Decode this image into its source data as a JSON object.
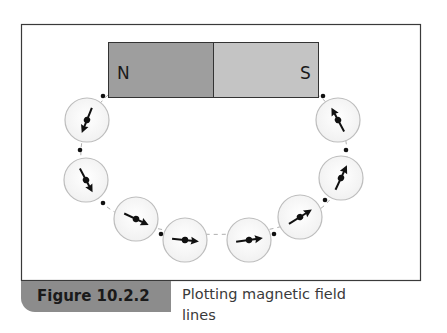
{
  "figure": {
    "magnet": {
      "north_label": "N",
      "south_label": "S",
      "north_color": "#9e9e9e",
      "south_color": "#c4c4c4"
    },
    "compasses": [
      {
        "id": 1,
        "cx": 87,
        "cy": 120,
        "angle": 245
      },
      {
        "id": 2,
        "cx": 86,
        "cy": 180,
        "angle": 68
      },
      {
        "id": 3,
        "cx": 136,
        "cy": 219,
        "angle": 25
      },
      {
        "id": 4,
        "cx": 185,
        "cy": 240,
        "angle": 5
      },
      {
        "id": 5,
        "cx": 249,
        "cy": 240,
        "angle": -8
      },
      {
        "id": 6,
        "cx": 300,
        "cy": 217,
        "angle": -32
      },
      {
        "id": 7,
        "cx": 341,
        "cy": 178,
        "angle": -65
      },
      {
        "id": 8,
        "cx": 338,
        "cy": 120,
        "angle": -118
      }
    ],
    "plot_points": [
      [
        103,
        96
      ],
      [
        80,
        150
      ],
      [
        103,
        203
      ],
      [
        161,
        234
      ],
      [
        274,
        234
      ],
      [
        325,
        200
      ],
      [
        346,
        150
      ],
      [
        323,
        96
      ]
    ]
  },
  "caption": {
    "label": "Figure 10.2.2",
    "text": "Plotting magnetic field lines"
  }
}
